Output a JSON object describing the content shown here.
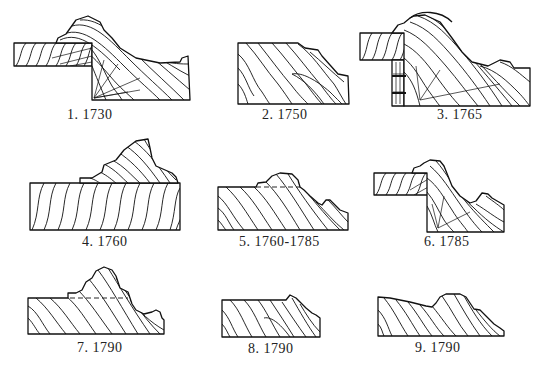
{
  "figures": [
    {
      "number": "1.",
      "year": "1730"
    },
    {
      "number": "2.",
      "year": "1750"
    },
    {
      "number": "3.",
      "year": "1765"
    },
    {
      "number": "4.",
      "year": "1760"
    },
    {
      "number": "5.",
      "year": "1760-1785"
    },
    {
      "number": "6.",
      "year": "1785"
    },
    {
      "number": "7.",
      "year": "1790"
    },
    {
      "number": "8.",
      "year": "1790"
    },
    {
      "number": "9.",
      "year": "1790"
    }
  ]
}
